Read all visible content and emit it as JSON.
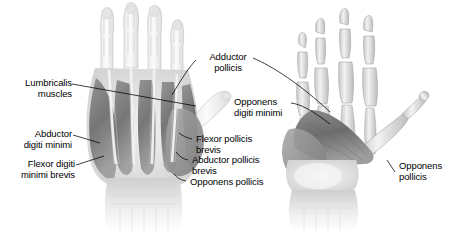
{
  "figure": {
    "background_color": "#ffffff",
    "ink_color": "#000000",
    "views": [
      {
        "name": "superficial-palmar-view",
        "side": "left"
      },
      {
        "name": "deep-palmar-view",
        "side": "right"
      }
    ]
  },
  "labels": {
    "lumbricalis_muscles": "Lumbricalis\nmuscles",
    "abductor_digiti_minimi": "Abductor\ndigiti minimi",
    "flexor_digiti_minimi_brevis": "Flexor digiti\nminimi brevis",
    "adductor_pollicis": "Adductor\npollicis",
    "opponens_digiti_minimi": "Opponens\ndigiti minimi",
    "flexor_pollicis_brevis": "Flexor pollicis\nbrevis",
    "abductor_pollicis_brevis": "Abductor pollicis\nbrevis",
    "opponens_pollicis_center": "Opponens pollicis",
    "opponens_pollicis_right": "Opponens\npollicis"
  }
}
